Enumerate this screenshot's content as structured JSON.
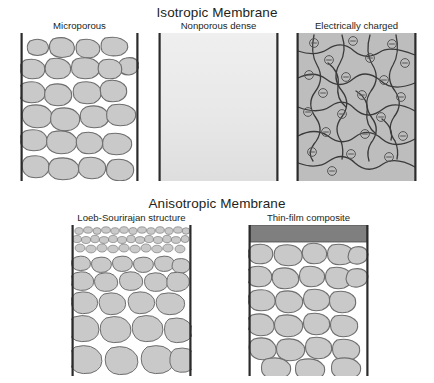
{
  "diagram": {
    "background_color": "#ffffff",
    "text_color": "#231f20",
    "sections": {
      "isotropic": {
        "title": "Isotropic Membrane",
        "panels": [
          {
            "id": "microporous",
            "label": "Microporous",
            "description": "Cross-section of membrane filled with irregular rounded grains separated by open pore space, bounded by two vertical walls",
            "fill_color": "#c9c9c9",
            "outline_color": "#6e6e6e",
            "wall_color": "#2b2b2b",
            "matrix_color": "#ffffff"
          },
          {
            "id": "nonporous-dense",
            "label": "Nonporous dense",
            "description": "Uniform pale dense film with no pores, bounded by two vertical walls",
            "fill_top_color": "#ececec",
            "fill_bottom_color": "#e0e0e0",
            "wall_color": "#2b2b2b"
          },
          {
            "id": "electrically-charged",
            "label": "Electrically charged",
            "description": "Gray matrix crossed by a network of dark curved channels with negatively charged sites marked by small circled minus signs",
            "matrix_color": "#bdbdbd",
            "channel_color": "#3a3a3a",
            "charge_symbol": "minus-in-circle",
            "charge_count": 22,
            "wall_color": "#2b2b2b"
          }
        ]
      },
      "anisotropic": {
        "title": "Anisotropic Membrane",
        "panels": [
          {
            "id": "loeb-sourirajan",
            "label": "Loeb-Sourirajan structure",
            "description": "Graded structure: a dense skin of very fine grains at the top grading into progressively larger grains toward the bottom",
            "fill_color": "#c9c9c9",
            "outline_color": "#6e6e6e",
            "wall_color": "#2b2b2b",
            "skin_layer": "fine dense top layer"
          },
          {
            "id": "thin-film-composite",
            "label": "Thin-film composite",
            "description": "A solid dark gray thin film laid across the top of a porous support layer of rounded grains",
            "film_color": "#7f7f7f",
            "fill_color": "#c9c9c9",
            "outline_color": "#6e6e6e",
            "wall_color": "#2b2b2b"
          }
        ]
      }
    }
  }
}
